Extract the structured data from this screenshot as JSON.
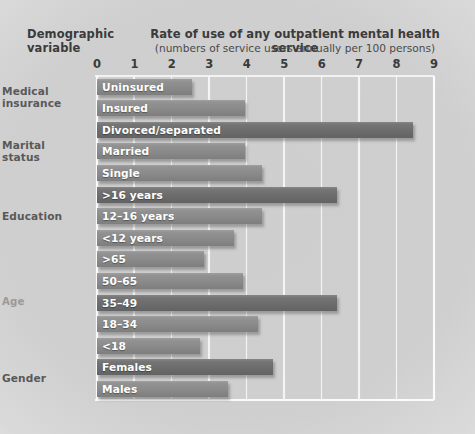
{
  "header": {
    "left_label": "Demographic\nvariable",
    "title": "Rate of use of any outpatient mental health service",
    "subtitle": "(numbers of service users annually per 100 persons)"
  },
  "colors": {
    "bar": "#8c8c8c",
    "bar_dark": "#6e6e6e",
    "gridline": "#f4f4f4",
    "background": "#cdcdcd",
    "label_text": "#ffffff",
    "group_label": "#595959",
    "group_label_faint": "#9a9a9a"
  },
  "groups": [
    {
      "name": "Medical insurance",
      "label": "Medical\ninsurance",
      "faint": false,
      "start_index": 0,
      "span": 2
    },
    {
      "name": "Marital status",
      "label": "Marital\nstatus",
      "faint": false,
      "start_index": 2,
      "span": 3
    },
    {
      "name": "Education",
      "label": "Education",
      "faint": false,
      "start_index": 5,
      "span": 3
    },
    {
      "name": "Age",
      "label": "Age",
      "faint": true,
      "start_index": 8,
      "span": 5
    },
    {
      "name": "Gender",
      "label": "Gender",
      "faint": false,
      "start_index": 13,
      "span": 2
    }
  ],
  "chart_data": {
    "type": "bar",
    "orientation": "horizontal",
    "title": "Rate of use of any outpatient mental health service",
    "subtitle": "(numbers of service users annually per 100 persons)",
    "xlabel": "",
    "ylabel": "Demographic variable",
    "xlim": [
      0,
      9
    ],
    "xticks": [
      0,
      1,
      2,
      3,
      4,
      5,
      6,
      7,
      8,
      9
    ],
    "xtick_labels": [
      "0",
      "1",
      "2",
      "3",
      "4",
      "5",
      "6",
      "7",
      "8",
      "9"
    ],
    "grid": true,
    "legend": false,
    "categories": [
      "Uninsured",
      "Insured",
      "Divorced/separated",
      "Married",
      "Single",
      ">16 years",
      "12–16 years",
      "<12 years",
      ">65",
      "50–65",
      "35–49",
      "18–34",
      "<18",
      "Females",
      "Males"
    ],
    "values": [
      2.55,
      3.95,
      8.45,
      3.95,
      4.4,
      6.4,
      4.4,
      3.65,
      2.85,
      3.9,
      6.4,
      4.3,
      2.75,
      4.7,
      3.5
    ],
    "group_of": [
      "Medical insurance",
      "Medical insurance",
      "Marital status",
      "Marital status",
      "Marital status",
      "Education",
      "Education",
      "Education",
      "Age",
      "Age",
      "Age",
      "Age",
      "Age",
      "Gender",
      "Gender"
    ],
    "emphasis": [
      false,
      false,
      true,
      false,
      false,
      true,
      false,
      false,
      false,
      false,
      true,
      false,
      false,
      true,
      false
    ]
  }
}
